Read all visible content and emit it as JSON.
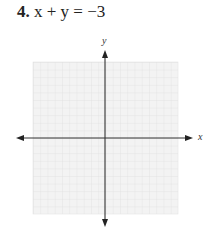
{
  "problem": {
    "number": "4.",
    "equation": "x + y = −3"
  },
  "graph": {
    "x_axis_label": "x",
    "y_axis_label": "y",
    "grid_cells_x": 20,
    "grid_cells_y": 20,
    "grid_color": "#e6e6e6",
    "grid_background": "#f3f3f3",
    "axis_color": "#333333"
  }
}
